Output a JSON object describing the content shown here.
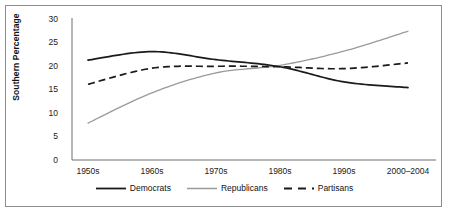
{
  "chart_data": {
    "type": "line",
    "title": "",
    "xlabel": "",
    "ylabel": "Southern Percentage",
    "categories": [
      "1950s",
      "1960s",
      "1970s",
      "1980s",
      "1990s",
      "2000–2004"
    ],
    "ylim": [
      0,
      30
    ],
    "yticks": [
      0,
      5,
      10,
      15,
      20,
      25,
      30
    ],
    "grid": false,
    "legend_position": "bottom-center",
    "series": [
      {
        "name": "Democrats",
        "style": "solid",
        "color": "#1a1a1a",
        "values": [
          21.1,
          22.9,
          21.2,
          19.7,
          16.5,
          15.3
        ]
      },
      {
        "name": "Republicans",
        "style": "solid",
        "color": "#9a9a9a",
        "values": [
          7.8,
          14.2,
          18.4,
          20.0,
          23.0,
          27.2
        ]
      },
      {
        "name": "Partisans",
        "style": "dashed",
        "color": "#1a1a1a",
        "values": [
          16.0,
          19.4,
          19.8,
          19.7,
          19.3,
          20.5
        ]
      }
    ]
  },
  "axis": {
    "y_tick_labels": [
      "30",
      "25",
      "20",
      "15",
      "10",
      "5",
      "0"
    ],
    "y_axis_title": "Southern Percentage",
    "x_tick_labels": [
      "1950s",
      "1960s",
      "1970s",
      "1980s",
      "1990s",
      "2000–2004"
    ]
  },
  "legend": {
    "items": [
      {
        "label": "Democrats",
        "swatch": "solid-dark-line-swatch"
      },
      {
        "label": "Republicans",
        "swatch": "solid-gray-line-swatch"
      },
      {
        "label": "Partisans",
        "swatch": "dashed-dark-line-swatch"
      }
    ]
  },
  "colors": {
    "democrats": "#1a1a1a",
    "republicans": "#9a9a9a",
    "partisans": "#1a1a1a",
    "axis": "#6f6f6f",
    "frame": "#8c8c8c"
  }
}
